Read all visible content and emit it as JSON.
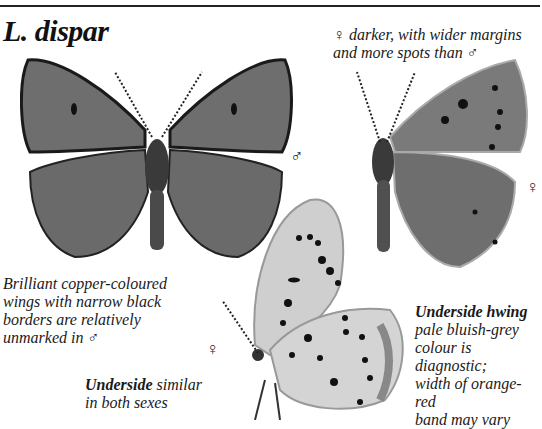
{
  "species": {
    "title": "L. dispar"
  },
  "captions": {
    "female_note": {
      "line1": "♀ darker, with wider margins",
      "line2": "and more spots than ♂"
    },
    "male_note": {
      "line1": "Brilliant copper-coloured",
      "line2": "wings with narrow black",
      "line3": "borders are relatively",
      "line4": "unmarked in ♂"
    },
    "underside_note": {
      "bold": "Underside",
      "rest1": " similar",
      "line2": "in both sexes"
    },
    "hwing_note": {
      "bold": "Underside hwing",
      "line2": "pale bluish-grey",
      "line3": "colour is diagnostic;",
      "line4": "width of orange-red",
      "line5": "band may vary"
    }
  },
  "symbols": {
    "male": "♂",
    "female": "♀"
  },
  "colors": {
    "wing_upper": "#6e6e6e",
    "wing_under": "#c9c9c9",
    "border": "#1a1a1a",
    "rule": "#222222"
  }
}
